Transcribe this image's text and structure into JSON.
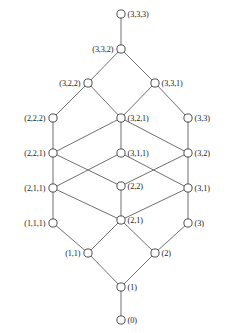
{
  "diagram": {
    "type": "hasse-lattice",
    "style": {
      "background": "#ffffff",
      "node_fill": "#ffffff",
      "node_stroke": "#3a3a3a",
      "edge_stroke": "#4a4a4a",
      "label_color": "#1a1a1a",
      "node_radius": 4.1,
      "edge_width": 0.8
    },
    "nodes": [
      {
        "id": "n333",
        "label": "(3,3,3)",
        "x": 121,
        "y": 14,
        "label_side": "right"
      },
      {
        "id": "n332",
        "label": "(3,3,2)",
        "x": 121,
        "y": 49,
        "label_side": "left"
      },
      {
        "id": "n322",
        "label": "(3,2,2)",
        "x": 88,
        "y": 83,
        "label_side": "left"
      },
      {
        "id": "n331",
        "label": "(3,3,1)",
        "x": 155,
        "y": 83,
        "label_side": "right"
      },
      {
        "id": "n222",
        "label": "(2,2,2)",
        "x": 53,
        "y": 118,
        "label_side": "left"
      },
      {
        "id": "n321",
        "label": "(3,2,1)",
        "x": 121,
        "y": 118,
        "label_side": "right"
      },
      {
        "id": "n33",
        "label": "(3,3)",
        "x": 188,
        "y": 118,
        "label_side": "right"
      },
      {
        "id": "n221",
        "label": "(2,2,1)",
        "x": 53,
        "y": 153,
        "label_side": "left"
      },
      {
        "id": "n311",
        "label": "(3,1,1)",
        "x": 121,
        "y": 153,
        "label_side": "right"
      },
      {
        "id": "n32",
        "label": "(3,2)",
        "x": 188,
        "y": 153,
        "label_side": "right"
      },
      {
        "id": "n211",
        "label": "(2,1,1)",
        "x": 53,
        "y": 188,
        "label_side": "left"
      },
      {
        "id": "n22",
        "label": "(2,2)",
        "x": 121,
        "y": 186,
        "label_side": "right"
      },
      {
        "id": "n31",
        "label": "(3,1)",
        "x": 188,
        "y": 188,
        "label_side": "right"
      },
      {
        "id": "n111",
        "label": "(1,1,1)",
        "x": 53,
        "y": 223,
        "label_side": "left"
      },
      {
        "id": "n21",
        "label": "(2,1)",
        "x": 121,
        "y": 220,
        "label_side": "right"
      },
      {
        "id": "n3",
        "label": "(3)",
        "x": 188,
        "y": 223,
        "label_side": "right"
      },
      {
        "id": "n11",
        "label": "(1,1)",
        "x": 88,
        "y": 253,
        "label_side": "left"
      },
      {
        "id": "n2",
        "label": "(2)",
        "x": 155,
        "y": 253,
        "label_side": "right"
      },
      {
        "id": "n1",
        "label": "(1)",
        "x": 121,
        "y": 287,
        "label_side": "right"
      },
      {
        "id": "n0",
        "label": "(0)",
        "x": 121,
        "y": 320,
        "label_side": "right"
      }
    ],
    "edges": [
      [
        "n333",
        "n332"
      ],
      [
        "n332",
        "n322"
      ],
      [
        "n332",
        "n331"
      ],
      [
        "n322",
        "n222"
      ],
      [
        "n322",
        "n321"
      ],
      [
        "n331",
        "n321"
      ],
      [
        "n331",
        "n33"
      ],
      [
        "n222",
        "n221"
      ],
      [
        "n321",
        "n221"
      ],
      [
        "n321",
        "n311"
      ],
      [
        "n321",
        "n32"
      ],
      [
        "n33",
        "n32"
      ],
      [
        "n221",
        "n211"
      ],
      [
        "n221",
        "n22"
      ],
      [
        "n311",
        "n211"
      ],
      [
        "n311",
        "n31"
      ],
      [
        "n32",
        "n22"
      ],
      [
        "n32",
        "n31"
      ],
      [
        "n211",
        "n111"
      ],
      [
        "n211",
        "n21"
      ],
      [
        "n22",
        "n21"
      ],
      [
        "n31",
        "n21"
      ],
      [
        "n31",
        "n3"
      ],
      [
        "n111",
        "n11"
      ],
      [
        "n21",
        "n11"
      ],
      [
        "n21",
        "n2"
      ],
      [
        "n3",
        "n2"
      ],
      [
        "n11",
        "n1"
      ],
      [
        "n2",
        "n1"
      ],
      [
        "n1",
        "n0"
      ]
    ]
  }
}
